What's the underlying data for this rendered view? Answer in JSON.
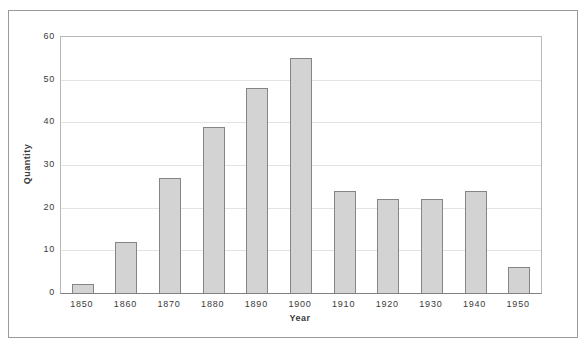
{
  "colors": {
    "bar_fill": "#d3d3d3",
    "bar_border": "#858585",
    "gridline": "#e3e3e3",
    "plot_border": "#b8b8b8",
    "axis_line": "#808080",
    "figure_border": "#9a9a9a",
    "text": "#3a3a3a",
    "background": "#ffffff"
  },
  "chart_data": {
    "type": "bar",
    "title": "",
    "xlabel": "Year",
    "ylabel": "Quantity",
    "categories": [
      "1850",
      "1860",
      "1870",
      "1880",
      "1890",
      "1900",
      "1910",
      "1920",
      "1930",
      "1940",
      "1950"
    ],
    "values": [
      2,
      12,
      27,
      39,
      48,
      55,
      24,
      22,
      22,
      24,
      6
    ],
    "ylim": [
      0,
      60
    ],
    "yticks": [
      0,
      10,
      20,
      30,
      40,
      50,
      60
    ],
    "grid": "horizontal",
    "legend": "none"
  }
}
